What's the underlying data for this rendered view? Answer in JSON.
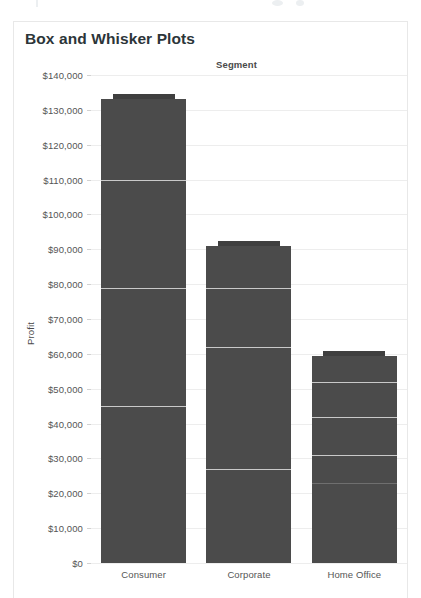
{
  "card": {
    "title": "Box and Whisker Plots"
  },
  "chart_data": {
    "type": "box",
    "title": "Box and Whisker Plots",
    "column_header": "Segment",
    "xlabel": "Segment",
    "ylabel": "Profit",
    "categories": [
      "Consumer",
      "Corporate",
      "Home Office"
    ],
    "ylim": [
      0,
      140000
    ],
    "ytick_values": [
      0,
      10000,
      20000,
      30000,
      40000,
      50000,
      60000,
      70000,
      80000,
      90000,
      100000,
      110000,
      120000,
      130000,
      140000
    ],
    "ytick_labels": [
      "$0",
      "$10,000",
      "$20,000",
      "$30,000",
      "$40,000",
      "$50,000",
      "$60,000",
      "$70,000",
      "$80,000",
      "$90,000",
      "$100,000",
      "$110,000",
      "$120,000",
      "$130,000",
      "$140,000"
    ],
    "grid": true,
    "legend": false,
    "series": [
      {
        "name": "Consumer",
        "upper_whisker": 134500,
        "box_top": 133000,
        "box_bottom": 0,
        "median": 79000,
        "reference_lines": [
          110000,
          79000,
          45000
        ],
        "lower_whisker": 0
      },
      {
        "name": "Corporate",
        "upper_whisker": 92400,
        "box_top": 91000,
        "box_bottom": 0,
        "median": 62000,
        "reference_lines": [
          79000,
          62000,
          27000
        ],
        "lower_whisker": 0
      },
      {
        "name": "Home Office",
        "upper_whisker": 60800,
        "box_top": 59500,
        "box_bottom": 0,
        "median": 42000,
        "reference_lines": [
          52000,
          42000,
          31000,
          23000
        ],
        "lower_whisker": 0
      }
    ]
  },
  "colors": {
    "mark": "#4b4b4b",
    "whisker": "#3f3f3f",
    "gridline": "#ededed",
    "median_line": "#c9c9c9",
    "text": "#555555",
    "title": "#2c3539",
    "card_border": "#e8e8e8"
  }
}
